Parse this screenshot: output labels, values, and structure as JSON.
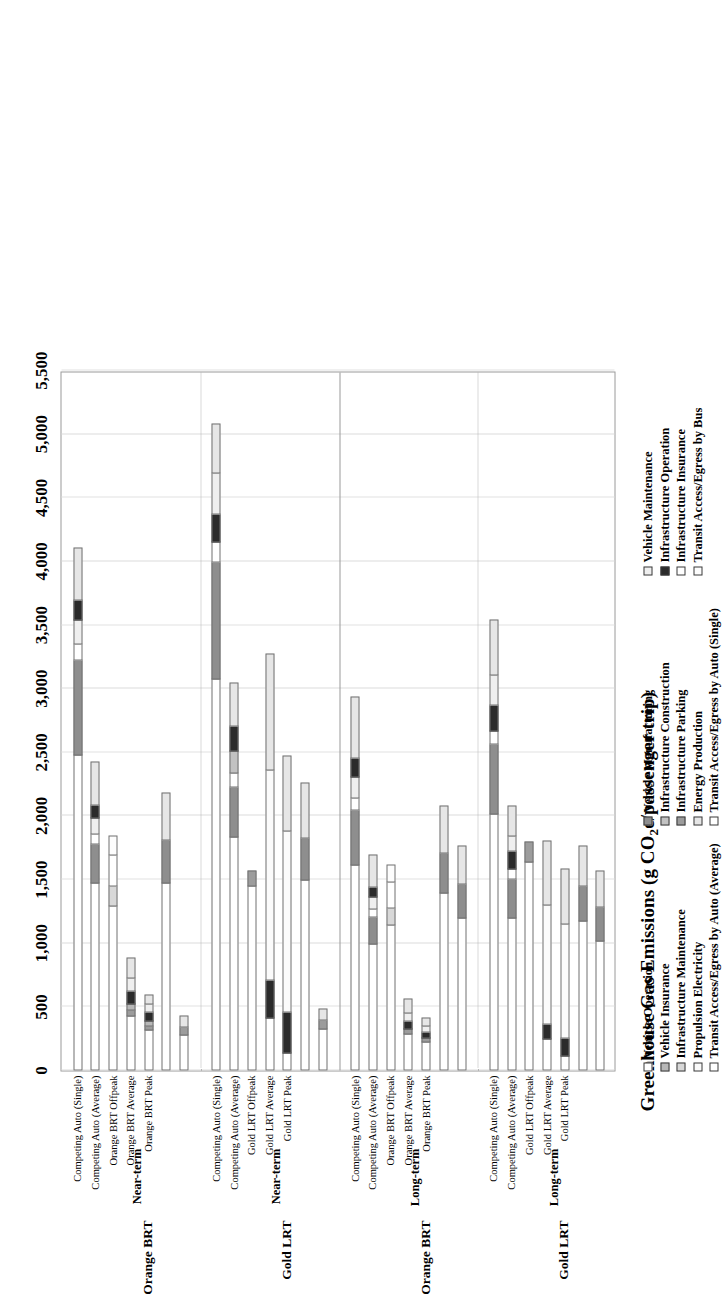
{
  "chart_data": {
    "type": "bar",
    "orientation": "horizontal-stacked",
    "title": "",
    "xlabel": "Greenhouse Gas Emissions (g CO2e/passenger trip)",
    "ylabel": "",
    "xlim": [
      0,
      5500
    ],
    "xticks": [
      "0",
      "500",
      "1,000",
      "1,500",
      "2,000",
      "2,500",
      "3,000",
      "3,500",
      "4,000",
      "4,500",
      "5,000",
      "5,500"
    ],
    "grid": true,
    "legend_position": "bottom",
    "series": [
      {
        "name": "Vehicle Operation",
        "key": "veh_op",
        "swatch": "s-veh-op"
      },
      {
        "name": "Vehicle Insurance",
        "key": "veh_ins",
        "swatch": "s-veh-ins"
      },
      {
        "name": "Infrastructure Maintenance",
        "key": "infra_maint",
        "swatch": "s-infra-maint"
      },
      {
        "name": "Propulsion Electricity",
        "key": "prop_elec",
        "swatch": "s-prop-elec"
      },
      {
        "name": "Transit Access/Egress by Auto (Average)",
        "key": "acc_auto_avg",
        "swatch": "s-acc-auto-avg"
      },
      {
        "name": "Vehicle Manufacturing",
        "key": "veh_manu",
        "swatch": "s-veh-manu"
      },
      {
        "name": "Infrastructure Construction",
        "key": "infra_constr",
        "swatch": "s-infra-constr"
      },
      {
        "name": "Infrastructure Parking",
        "key": "infra_park",
        "swatch": "s-infra-park"
      },
      {
        "name": "Energy Production",
        "key": "energy_prod",
        "swatch": "s-energy-prod"
      },
      {
        "name": "Transit Access/Egress by Auto (Single)",
        "key": "acc_auto_sing",
        "swatch": "s-acc-auto-sing"
      },
      {
        "name": "Vehicle Maintenance",
        "key": "veh_maint",
        "swatch": "s-veh-maint"
      },
      {
        "name": "Infrastructure Operation",
        "key": "infra_oper",
        "swatch": "s-infra-oper"
      },
      {
        "name": "Infrastructure Insurance",
        "key": "infra_insur",
        "swatch": "s-infra-insur"
      },
      {
        "name": "Transit Access/Egress by Bus",
        "key": "acc_bus",
        "swatch": "s-acc-bus"
      }
    ],
    "legend_columns": [
      [
        "Vehicle Operation",
        "Vehicle Insurance",
        "Infrastructure Maintenance",
        "Propulsion Electricity",
        "Transit Access/Egress by Auto (Average)"
      ],
      [
        "Vehicle Manufacturing",
        "Infrastructure Construction",
        "Infrastructure Parking",
        "Energy Production",
        "Transit Access/Egress by Auto (Single)"
      ],
      [
        "Vehicle Maintenance",
        "Infrastructure Operation",
        "Infrastructure Insurance",
        "Transit Access/Egress by Bus"
      ]
    ],
    "groups": [
      {
        "scenario": "Orange BRT",
        "horizon": "Near-term",
        "bars": [
          {
            "label": "Competing Auto (Single)",
            "total": 4150,
            "segments": [
              {
                "series": "veh_op",
                "value": 2480
              },
              {
                "series": "veh_manu",
                "value": 760
              },
              {
                "series": "infra_insur",
                "value": 130
              },
              {
                "series": "veh_maint",
                "value": 200
              },
              {
                "series": "infra_oper",
                "value": 160
              },
              {
                "series": "energy_prod",
                "value": 420
              }
            ]
          },
          {
            "label": "Competing Auto (Average)",
            "total": 2470,
            "segments": [
              {
                "series": "veh_op",
                "value": 1480
              },
              {
                "series": "veh_manu",
                "value": 310
              },
              {
                "series": "infra_insur",
                "value": 90
              },
              {
                "series": "veh_maint",
                "value": 130
              },
              {
                "series": "infra_oper",
                "value": 110
              },
              {
                "series": "energy_prod",
                "value": 350
              }
            ]
          },
          {
            "label": "Orange BRT Offpeak",
            "total": 1870,
            "segments": [
              {
                "series": "veh_op",
                "value": 1300
              },
              {
                "series": "infra_maint",
                "value": 160
              },
              {
                "series": "acc_auto_sing",
                "value": 250
              },
              {
                "series": "acc_bus",
                "value": 160
              }
            ]
          },
          {
            "label": "Orange BRT Average",
            "total": 930,
            "segments": [
              {
                "series": "veh_op",
                "value": 430
              },
              {
                "series": "infra_park",
                "value": 60
              },
              {
                "series": "veh_ins",
                "value": 50
              },
              {
                "series": "infra_oper",
                "value": 110
              },
              {
                "series": "veh_maint",
                "value": 110
              },
              {
                "series": "energy_prod",
                "value": 170
              }
            ]
          },
          {
            "label": "Orange BRT Peak",
            "total": 640,
            "segments": [
              {
                "series": "veh_op",
                "value": 320
              },
              {
                "series": "infra_park",
                "value": 45
              },
              {
                "series": "veh_ins",
                "value": 40
              },
              {
                "series": "infra_oper",
                "value": 85
              },
              {
                "series": "veh_maint",
                "value": 70
              },
              {
                "series": "energy_prod",
                "value": 80
              }
            ]
          },
          {
            "label": "",
            "total": 2200,
            "segments": [
              {
                "series": "veh_op",
                "value": 1480
              },
              {
                "series": "veh_manu",
                "value": 340
              },
              {
                "series": "energy_prod",
                "value": 380
              }
            ]
          },
          {
            "label": "",
            "total": 450,
            "segments": [
              {
                "series": "veh_op",
                "value": 280
              },
              {
                "series": "infra_park",
                "value": 70
              },
              {
                "series": "energy_prod",
                "value": 100
              }
            ]
          }
        ]
      },
      {
        "scenario": "Gold LRT",
        "horizon": "Near-term",
        "bars": [
          {
            "label": "Competing Auto (Single)",
            "total": 5120,
            "segments": [
              {
                "series": "veh_op",
                "value": 3080
              },
              {
                "series": "veh_manu",
                "value": 930
              },
              {
                "series": "infra_insur",
                "value": 160
              },
              {
                "series": "infra_oper",
                "value": 230
              },
              {
                "series": "veh_maint",
                "value": 330
              },
              {
                "series": "energy_prod",
                "value": 390
              }
            ]
          },
          {
            "label": "Competing Auto (Average)",
            "total": 3090,
            "segments": [
              {
                "series": "veh_op",
                "value": 1840
              },
              {
                "series": "veh_manu",
                "value": 400
              },
              {
                "series": "infra_insur",
                "value": 120
              },
              {
                "series": "infra_constr",
                "value": 180
              },
              {
                "series": "infra_oper",
                "value": 200
              },
              {
                "series": "energy_prod",
                "value": 350
              }
            ]
          },
          {
            "label": "Gold LRT Offpeak",
            "total": 1580,
            "segments": [
              {
                "series": "veh_op",
                "value": 1450
              },
              {
                "series": "infra_park",
                "value": 130
              }
            ]
          },
          {
            "label": "Gold LRT Average",
            "total": 3300,
            "segments": [
              {
                "series": "veh_op",
                "value": 420
              },
              {
                "series": "infra_oper",
                "value": 300
              },
              {
                "series": "prop_elec",
                "value": 1660
              },
              {
                "series": "energy_prod",
                "value": 920
              }
            ]
          },
          {
            "label": "Gold LRT Peak",
            "total": 2500,
            "segments": [
              {
                "series": "veh_op",
                "value": 140
              },
              {
                "series": "infra_oper",
                "value": 330
              },
              {
                "series": "prop_elec",
                "value": 1430
              },
              {
                "series": "energy_prod",
                "value": 600
              }
            ]
          },
          {
            "label": "",
            "total": 2280,
            "segments": [
              {
                "series": "veh_op",
                "value": 1500
              },
              {
                "series": "veh_manu",
                "value": 340
              },
              {
                "series": "energy_prod",
                "value": 440
              }
            ]
          },
          {
            "label": "",
            "total": 500,
            "segments": [
              {
                "series": "veh_op",
                "value": 330
              },
              {
                "series": "infra_park",
                "value": 80
              },
              {
                "series": "energy_prod",
                "value": 90
              }
            ]
          }
        ]
      },
      {
        "scenario": "Orange BRT",
        "horizon": "Long-term",
        "bars": [
          {
            "label": "Competing Auto (Single)",
            "total": 2980,
            "segments": [
              {
                "series": "veh_op",
                "value": 1620
              },
              {
                "series": "veh_manu",
                "value": 440
              },
              {
                "series": "infra_insur",
                "value": 100
              },
              {
                "series": "veh_maint",
                "value": 170
              },
              {
                "series": "infra_oper",
                "value": 160
              },
              {
                "series": "energy_prod",
                "value": 490
              }
            ]
          },
          {
            "label": "Competing Auto (Average)",
            "total": 1740,
            "segments": [
              {
                "series": "veh_op",
                "value": 1000
              },
              {
                "series": "veh_manu",
                "value": 220
              },
              {
                "series": "infra_insur",
                "value": 70
              },
              {
                "series": "veh_maint",
                "value": 100
              },
              {
                "series": "infra_oper",
                "value": 90
              },
              {
                "series": "energy_prod",
                "value": 260
              }
            ]
          },
          {
            "label": "Orange BRT Offpeak",
            "total": 1640,
            "segments": [
              {
                "series": "veh_op",
                "value": 1150
              },
              {
                "series": "infra_maint",
                "value": 140
              },
              {
                "series": "acc_auto_sing",
                "value": 210
              },
              {
                "series": "acc_bus",
                "value": 140
              }
            ]
          },
          {
            "label": "Orange BRT Average",
            "total": 600,
            "segments": [
              {
                "series": "veh_op",
                "value": 290
              },
              {
                "series": "infra_park",
                "value": 50
              },
              {
                "series": "infra_oper",
                "value": 70
              },
              {
                "series": "veh_maint",
                "value": 70
              },
              {
                "series": "energy_prod",
                "value": 120
              }
            ]
          },
          {
            "label": "Orange BRT Peak",
            "total": 450,
            "segments": [
              {
                "series": "veh_op",
                "value": 230
              },
              {
                "series": "infra_park",
                "value": 40
              },
              {
                "series": "infra_oper",
                "value": 55
              },
              {
                "series": "veh_maint",
                "value": 50
              },
              {
                "series": "energy_prod",
                "value": 75
              }
            ]
          },
          {
            "label": "",
            "total": 2100,
            "segments": [
              {
                "series": "veh_op",
                "value": 1400
              },
              {
                "series": "veh_manu",
                "value": 320
              },
              {
                "series": "energy_prod",
                "value": 380
              }
            ]
          },
          {
            "label": "",
            "total": 1780,
            "segments": [
              {
                "series": "veh_op",
                "value": 1200
              },
              {
                "series": "veh_manu",
                "value": 280
              },
              {
                "series": "energy_prod",
                "value": 300
              }
            ]
          }
        ]
      },
      {
        "scenario": "Gold LRT",
        "horizon": "Long-term",
        "bars": [
          {
            "label": "Competing Auto (Single)",
            "total": 3580,
            "segments": [
              {
                "series": "veh_op",
                "value": 2020
              },
              {
                "series": "veh_manu",
                "value": 560
              },
              {
                "series": "infra_insur",
                "value": 110
              },
              {
                "series": "infra_oper",
                "value": 210
              },
              {
                "series": "veh_maint",
                "value": 240
              },
              {
                "series": "energy_prod",
                "value": 440
              }
            ]
          },
          {
            "label": "Competing Auto (Average)",
            "total": 2120,
            "segments": [
              {
                "series": "veh_op",
                "value": 1200
              },
              {
                "series": "veh_manu",
                "value": 320
              },
              {
                "series": "infra_insur",
                "value": 80
              },
              {
                "series": "infra_oper",
                "value": 150
              },
              {
                "series": "veh_maint",
                "value": 130
              },
              {
                "series": "energy_prod",
                "value": 240
              }
            ]
          },
          {
            "label": "Gold LRT Offpeak",
            "total": 1810,
            "segments": [
              {
                "series": "veh_op",
                "value": 1640
              },
              {
                "series": "infra_park",
                "value": 170
              }
            ]
          },
          {
            "label": "Gold LRT Average",
            "total": 1830,
            "segments": [
              {
                "series": "veh_op",
                "value": 250
              },
              {
                "series": "infra_oper",
                "value": 130
              },
              {
                "series": "prop_elec",
                "value": 940
              },
              {
                "series": "energy_prod",
                "value": 510
              }
            ]
          },
          {
            "label": "Gold LRT Peak",
            "total": 1610,
            "segments": [
              {
                "series": "veh_op",
                "value": 120
              },
              {
                "series": "infra_oper",
                "value": 150
              },
              {
                "series": "prop_elec",
                "value": 900
              },
              {
                "series": "energy_prod",
                "value": 440
              }
            ]
          },
          {
            "label": "",
            "total": 1780,
            "segments": [
              {
                "series": "veh_op",
                "value": 1180
              },
              {
                "series": "veh_manu",
                "value": 280
              },
              {
                "series": "energy_prod",
                "value": 320
              }
            ]
          },
          {
            "label": "",
            "total": 1590,
            "segments": [
              {
                "series": "veh_op",
                "value": 1020
              },
              {
                "series": "veh_manu",
                "value": 280
              },
              {
                "series": "energy_prod",
                "value": 290
              }
            ]
          }
        ]
      }
    ],
    "bar_notes": [
      "Bus",
      "Auto"
    ]
  }
}
